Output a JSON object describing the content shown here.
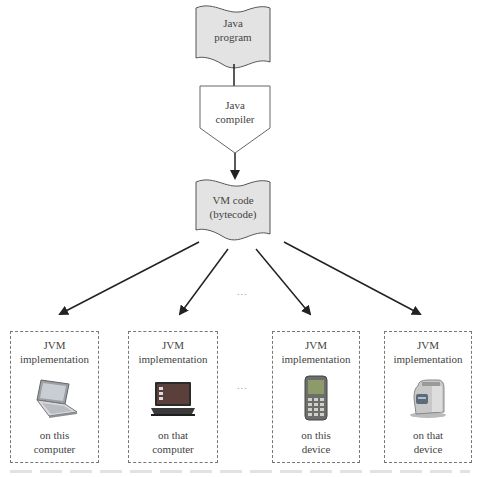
{
  "diagram": {
    "type": "flowchart",
    "nodes": {
      "source": {
        "shape": "document",
        "label_line1": "Java",
        "label_line2": "program"
      },
      "compiler": {
        "shape": "pentagon-process",
        "label_line1": "Java",
        "label_line2": "compiler"
      },
      "bytecode": {
        "shape": "document",
        "label_line1": "VM code",
        "label_line2": "(bytecode)"
      }
    },
    "edges": [
      {
        "from": "source",
        "to": "compiler",
        "arrow": false
      },
      {
        "from": "compiler",
        "to": "bytecode",
        "arrow": true
      },
      {
        "from": "bytecode",
        "to": "targets.0",
        "arrow": true
      },
      {
        "from": "bytecode",
        "to": "targets.1",
        "arrow": true
      },
      {
        "from": "bytecode",
        "to": "targets.2",
        "arrow": true
      },
      {
        "from": "bytecode",
        "to": "targets.3",
        "arrow": true
      }
    ],
    "ellipsis": "...",
    "targets": [
      {
        "title_line1": "JVM",
        "title_line2": "implementation",
        "device_icon": "laptop-icon",
        "caption_line1": "on this",
        "caption_line2": "computer"
      },
      {
        "title_line1": "JVM",
        "title_line2": "implementation",
        "device_icon": "notebook-computer-icon",
        "caption_line1": "on that",
        "caption_line2": "computer"
      },
      {
        "title_line1": "JVM",
        "title_line2": "implementation",
        "device_icon": "mobile-phone-icon",
        "caption_line1": "on this",
        "caption_line2": "device"
      },
      {
        "title_line1": "JVM",
        "title_line2": "implementation",
        "device_icon": "toaster-icon",
        "caption_line1": "on that",
        "caption_line2": "device"
      }
    ],
    "colors": {
      "document_fill": "#e3e3e3",
      "stroke": "#222222",
      "dashed_border": "#777777"
    }
  }
}
